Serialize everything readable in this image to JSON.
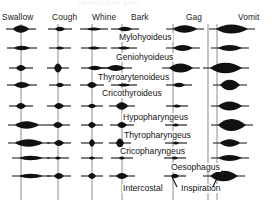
{
  "figure": {
    "top_cut_title": "TRANSIENT EMG",
    "column_headers": [
      {
        "label": "Swallow",
        "x": 2,
        "y": 12
      },
      {
        "label": "Cough",
        "x": 52,
        "y": 12
      },
      {
        "label": "Whine",
        "x": 92,
        "y": 12
      },
      {
        "label": "Bark",
        "x": 131,
        "y": 12
      },
      {
        "label": "Gag",
        "x": 186,
        "y": 12
      },
      {
        "label": "Vomit",
        "x": 238,
        "y": 12
      }
    ],
    "muscle_labels": [
      {
        "label": "Mylohyoideus",
        "x": 118,
        "y": 33
      },
      {
        "label": "Geniohyoideus",
        "x": 115,
        "y": 53
      },
      {
        "label": "Thyroarytenoideus",
        "x": 97,
        "y": 73
      },
      {
        "label": "Cricothyroideus",
        "x": 101,
        "y": 89
      },
      {
        "label": "Hypopharyngeus",
        "x": 122,
        "y": 113
      },
      {
        "label": "Thyropharyngeus",
        "x": 123,
        "y": 131
      },
      {
        "label": "Cricopharyngeus",
        "x": 119,
        "y": 147
      },
      {
        "label": "Oesophagus",
        "x": 170,
        "y": 163
      },
      {
        "label": "Intercostal",
        "x": 122,
        "y": 184
      },
      {
        "label": "Inspiration",
        "x": 180,
        "y": 184
      }
    ],
    "colors": {
      "trace": "#111111",
      "axis": "#808080",
      "background": "#ffffff",
      "text": "#141414"
    },
    "axis_lines": [
      {
        "name": "swallow-axis",
        "x": 21,
        "y1": 24,
        "y2": 200
      },
      {
        "name": "cough-axis",
        "x": 58,
        "y1": 24,
        "y2": 200
      },
      {
        "name": "whine-axis",
        "x": 92,
        "y1": 24,
        "y2": 200
      },
      {
        "name": "bark-axis",
        "x": 122,
        "y1": 24,
        "y2": 200
      },
      {
        "name": "gag-axis",
        "x": 173,
        "y1": 24,
        "y2": 200
      },
      {
        "name": "vomit-axis-a",
        "x": 208,
        "y1": 24,
        "y2": 200
      },
      {
        "name": "vomit-axis-b",
        "x": 217,
        "y1": 24,
        "y2": 200
      }
    ],
    "rows": [
      {
        "muscle": "Mylohyoideus",
        "y": 29
      },
      {
        "muscle": "Geniohyoideus",
        "y": 48
      },
      {
        "muscle": "Thyroarytenoideus",
        "y": 68
      },
      {
        "muscle": "Cricothyroideus",
        "y": 85
      },
      {
        "muscle": "Hypopharyngeus",
        "y": 106
      },
      {
        "muscle": "Thyropharyngeus",
        "y": 125
      },
      {
        "muscle": "Cricopharyngeus",
        "y": 143
      },
      {
        "muscle": "Oesophagus",
        "y": 158
      },
      {
        "muscle": "Intercostal",
        "y": 176
      }
    ],
    "chart_data": {
      "type": "emg-spindle-matrix",
      "title": "Transient EMG activity patterns",
      "xlabel": "",
      "ylabel": "",
      "behaviours": [
        "Swallow",
        "Cough",
        "Whine",
        "Bark",
        "Gag",
        "Vomit"
      ],
      "muscles": [
        "Mylohyoideus",
        "Geniohyoideus",
        "Thyroarytenoideus",
        "Cricothyroideus",
        "Hypopharyngeus",
        "Thyropharyngeus",
        "Cricopharyngeus",
        "Oesophagus",
        "Intercostal"
      ],
      "note": "Each cell is a horizontal EMG burst trace drawn as a filled lens/spindle whose half-height encodes burst amplitude and whose width encodes burst duration. Values below are [offset_px_from_axis, half_width_px, half_height_px] for each burst.",
      "cells": [
        {
          "behaviour": "Swallow",
          "axis": 21,
          "bursts": [
            {
              "row": 0,
              "off": 0,
              "w": 8,
              "h": 5
            },
            {
              "row": 1,
              "off": 1,
              "w": 8,
              "h": 3
            },
            {
              "row": 2,
              "off": 0,
              "w": 5,
              "h": 4
            },
            {
              "row": 3,
              "off": 1,
              "w": 8,
              "h": 4
            },
            {
              "row": 4,
              "off": 0,
              "w": 5,
              "h": 4
            },
            {
              "row": 5,
              "off": 6,
              "w": 12,
              "h": 5
            },
            {
              "row": 6,
              "off": 8,
              "w": 14,
              "h": 5
            },
            {
              "row": 7,
              "off": 10,
              "w": 12,
              "h": 3
            },
            {
              "row": 8,
              "off": 10,
              "w": 12,
              "h": 3
            }
          ]
        },
        {
          "behaviour": "Cough",
          "axis": 58,
          "bursts": [
            {
              "row": 0,
              "off": 2,
              "w": 5,
              "h": 3
            },
            {
              "row": 1,
              "off": 2,
              "w": 4,
              "h": 2
            },
            {
              "row": 2,
              "off": 0,
              "w": 4,
              "h": 6
            },
            {
              "row": 3,
              "off": 2,
              "w": 4,
              "h": 3
            },
            {
              "row": 4,
              "off": 1,
              "w": 5,
              "h": 4
            },
            {
              "row": 5,
              "off": 0,
              "w": 5,
              "h": 4
            },
            {
              "row": 6,
              "off": 1,
              "w": 5,
              "h": 4
            },
            {
              "row": 7,
              "off": 0,
              "w": 3,
              "h": 2
            },
            {
              "row": 8,
              "off": 1,
              "w": 5,
              "h": 4
            }
          ]
        },
        {
          "behaviour": "Whine",
          "axis": 92,
          "bursts": [
            {
              "row": 0,
              "off": 2,
              "w": 7,
              "h": 2
            },
            {
              "row": 1,
              "off": 2,
              "w": 6,
              "h": 2
            },
            {
              "row": 2,
              "off": 3,
              "w": 7,
              "h": 3
            },
            {
              "row": 3,
              "off": 0,
              "w": 5,
              "h": 4
            },
            {
              "row": 4,
              "off": 0,
              "w": 4,
              "h": 3
            },
            {
              "row": 5,
              "off": 0,
              "w": 4,
              "h": 4
            },
            {
              "row": 6,
              "off": 0,
              "w": 3,
              "h": 5
            },
            {
              "row": 7,
              "off": 0,
              "w": 3,
              "h": 2
            },
            {
              "row": 8,
              "off": 0,
              "w": 4,
              "h": 4
            }
          ]
        },
        {
          "behaviour": "Bark",
          "axis": 122,
          "bursts": [
            {
              "row": 0,
              "off": 3,
              "w": 7,
              "h": 3
            },
            {
              "row": 1,
              "off": 2,
              "w": 6,
              "h": 2
            },
            {
              "row": 2,
              "off": -6,
              "w": 9,
              "h": 4
            },
            {
              "row": 3,
              "off": 2,
              "w": 6,
              "h": 2
            },
            {
              "row": 4,
              "off": 0,
              "w": 6,
              "h": 5
            },
            {
              "row": 5,
              "off": 0,
              "w": 5,
              "h": 4
            },
            {
              "row": 6,
              "off": -2,
              "w": 4,
              "h": 6
            },
            {
              "row": 7,
              "off": 0,
              "w": 3,
              "h": 2
            },
            {
              "row": 8,
              "off": 0,
              "w": 6,
              "h": 4
            }
          ]
        },
        {
          "behaviour": "Gag",
          "axis": 173,
          "bursts": [
            {
              "row": 0,
              "off": 12,
              "w": 12,
              "h": 5
            },
            {
              "row": 1,
              "off": 10,
              "w": 10,
              "h": 4
            },
            {
              "row": 2,
              "off": 8,
              "w": 12,
              "h": 6
            },
            {
              "row": 3,
              "off": 6,
              "w": 6,
              "h": 3
            },
            {
              "row": 4,
              "off": 4,
              "w": 4,
              "h": 2
            },
            {
              "row": 5,
              "off": 3,
              "w": 3,
              "h": 2
            },
            {
              "row": 6,
              "off": 3,
              "w": 3,
              "h": 2
            },
            {
              "row": 7,
              "off": 2,
              "w": 3,
              "h": 2
            },
            {
              "row": 8,
              "off": 2,
              "w": 4,
              "h": 3
            }
          ]
        },
        {
          "behaviour": "Vomit",
          "axis": 212,
          "bursts": [
            {
              "row": 0,
              "off": 20,
              "w": 16,
              "h": 6
            },
            {
              "row": 1,
              "off": 18,
              "w": 12,
              "h": 4
            },
            {
              "row": 2,
              "off": 14,
              "w": 16,
              "h": 7
            },
            {
              "row": 3,
              "off": 18,
              "w": 10,
              "h": 7
            },
            {
              "row": 4,
              "off": 18,
              "w": 12,
              "h": 6
            },
            {
              "row": 5,
              "off": 20,
              "w": 14,
              "h": 8
            },
            {
              "row": 6,
              "off": 18,
              "w": 10,
              "h": 5
            },
            {
              "row": 7,
              "off": 18,
              "w": 12,
              "h": 4
            },
            {
              "row": 8,
              "off": 12,
              "w": 14,
              "h": 7
            }
          ]
        }
      ]
    }
  }
}
